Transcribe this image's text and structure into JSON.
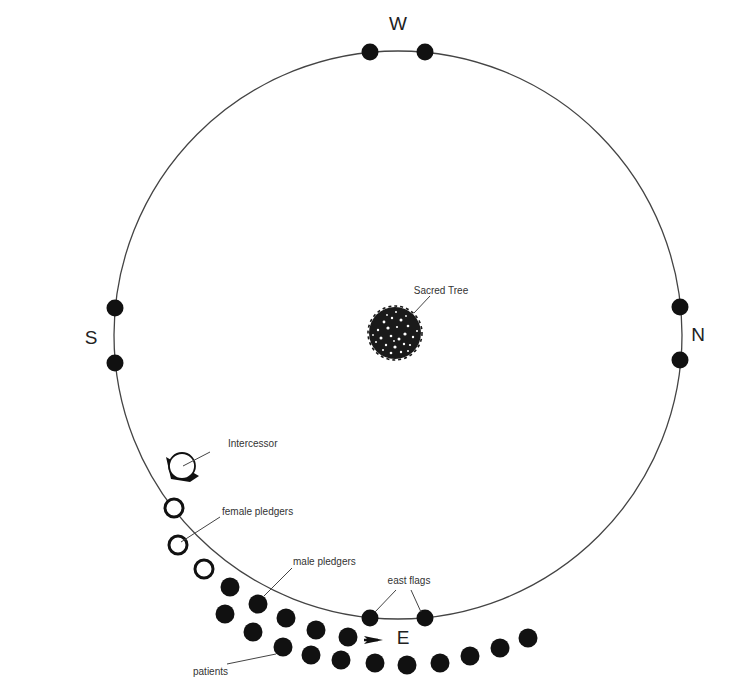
{
  "directions": {
    "west": "W",
    "south": "S",
    "north": "N",
    "east": "E"
  },
  "labels": {
    "sacred_tree": "Sacred Tree",
    "intercessor": "Intercessor",
    "female_pledgers": "female pledgers",
    "male_pledgers": "male pledgers",
    "east_flags": "east flags",
    "patients": "patients"
  },
  "colors": {
    "ink": "#111111",
    "line": "#444444",
    "text": "#333333",
    "background": "#ffffff"
  },
  "arena": {
    "cx": 398,
    "cy": 335,
    "r": 284
  },
  "flags": {
    "west": [
      [
        370,
        52
      ],
      [
        425,
        52
      ]
    ],
    "south": [
      [
        115,
        308
      ],
      [
        115,
        363
      ]
    ],
    "north": [
      [
        680,
        307
      ],
      [
        680,
        360
      ]
    ],
    "east": [
      [
        370,
        618
      ],
      [
        425,
        618
      ]
    ]
  },
  "female_pledgers": [
    [
      174,
      508
    ],
    [
      178,
      545
    ],
    [
      204,
      569
    ]
  ],
  "male_pledgers": [
    [
      230,
      587
    ],
    [
      258,
      604
    ],
    [
      286,
      618
    ],
    [
      316,
      630
    ],
    [
      348,
      637
    ]
  ],
  "patients": [
    [
      225,
      614
    ],
    [
      253,
      632
    ],
    [
      283,
      647
    ],
    [
      311,
      655
    ],
    [
      341,
      660
    ],
    [
      375,
      663
    ],
    [
      407,
      665
    ],
    [
      440,
      663
    ],
    [
      470,
      656
    ],
    [
      500,
      648
    ],
    [
      528,
      638
    ]
  ]
}
